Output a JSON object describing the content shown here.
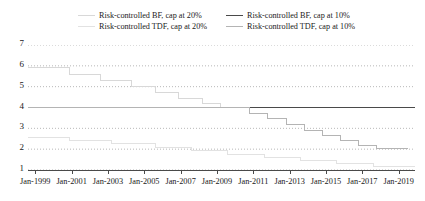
{
  "chart_data": {
    "type": "line",
    "title": "",
    "subtitle": "",
    "xlabel": "",
    "ylabel": "",
    "grid": true,
    "grid_style": "dotted-horizontal",
    "legend_position": "top",
    "legend_columns": 2,
    "step_plot": true,
    "xlim": [
      "Jan-1998",
      "Jan-2020"
    ],
    "ylim": [
      1,
      7
    ],
    "yticks": [
      7,
      6,
      5,
      4,
      3,
      2,
      1
    ],
    "xticks": [
      "Jan-1999",
      "Jan-2001",
      "Jan-2003",
      "Jan-2005",
      "Jan-2007",
      "Jan-2009",
      "Jan-2011",
      "Jan-2013",
      "Jan-2015",
      "Jan-2017",
      "Jan-2019"
    ],
    "x_start_year": 1998.6,
    "x_end_year": 2019.9,
    "series": [
      {
        "name": "Risk-controlled BF, cap at 20%",
        "color": "#d8d8d8",
        "width": 1.0,
        "points": [
          [
            1998.6,
            5.92
          ],
          [
            2000.9,
            5.92
          ],
          [
            2000.9,
            5.6
          ],
          [
            2002.6,
            5.6
          ],
          [
            2002.6,
            5.3
          ],
          [
            2004.3,
            5.3
          ],
          [
            2004.3,
            5.02
          ],
          [
            2005.6,
            5.02
          ],
          [
            2005.6,
            4.72
          ],
          [
            2006.9,
            4.72
          ],
          [
            2006.9,
            4.42
          ],
          [
            2008.2,
            4.42
          ],
          [
            2008.2,
            4.18
          ],
          [
            2009.2,
            4.18
          ],
          [
            2009.2,
            3.98
          ],
          [
            2019.9,
            3.98
          ]
        ]
      },
      {
        "name": "Risk-controlled BF, cap at 10%",
        "color": "#4a4a4a",
        "width": 1.1,
        "points": [
          [
            1998.6,
            4.02
          ],
          [
            2019.9,
            4.02
          ]
        ]
      },
      {
        "name": "Risk-controlled TDF, cap at 20%",
        "color": "#e2e2e2",
        "width": 1.0,
        "points": [
          [
            1998.6,
            2.58
          ],
          [
            2000.9,
            2.58
          ],
          [
            2000.9,
            2.42
          ],
          [
            2003.2,
            2.42
          ],
          [
            2003.2,
            2.25
          ],
          [
            2005.6,
            2.25
          ],
          [
            2005.6,
            2.08
          ],
          [
            2007.6,
            2.08
          ],
          [
            2007.6,
            1.92
          ],
          [
            2009.6,
            1.92
          ],
          [
            2009.6,
            1.75
          ],
          [
            2011.6,
            1.75
          ],
          [
            2011.6,
            1.6
          ],
          [
            2013.6,
            1.6
          ],
          [
            2013.6,
            1.45
          ],
          [
            2015.6,
            1.45
          ],
          [
            2015.6,
            1.3
          ],
          [
            2017.6,
            1.3
          ],
          [
            2017.6,
            1.18
          ],
          [
            2019.9,
            1.18
          ]
        ]
      },
      {
        "name": "Risk-controlled TDF, cap at 10%",
        "color": "#b4b4b4",
        "width": 1.0,
        "points": [
          [
            1998.6,
            3.98
          ],
          [
            2010.8,
            3.98
          ],
          [
            2010.8,
            3.72
          ],
          [
            2011.8,
            3.72
          ],
          [
            2011.8,
            3.45
          ],
          [
            2012.8,
            3.45
          ],
          [
            2012.8,
            3.18
          ],
          [
            2013.8,
            3.18
          ],
          [
            2013.8,
            2.92
          ],
          [
            2014.8,
            2.92
          ],
          [
            2014.8,
            2.65
          ],
          [
            2015.8,
            2.65
          ],
          [
            2015.8,
            2.42
          ],
          [
            2016.8,
            2.42
          ],
          [
            2016.8,
            2.2
          ],
          [
            2017.8,
            2.2
          ],
          [
            2017.8,
            2.02
          ],
          [
            2019.5,
            2.02
          ]
        ]
      }
    ]
  },
  "legend": {
    "items": [
      {
        "label": "Risk-controlled BF, cap at 20%",
        "color": "#d8d8d8"
      },
      {
        "label": "Risk-controlled BF, cap at 10%",
        "color": "#4a4a4a"
      },
      {
        "label": "Risk-controlled TDF, cap at 20%",
        "color": "#e2e2e2"
      },
      {
        "label": "Risk-controlled TDF, cap at 10%",
        "color": "#b4b4b4"
      }
    ]
  },
  "axes": {
    "y_labels": [
      "7",
      "6",
      "5",
      "4",
      "3",
      "2",
      "1"
    ],
    "x_labels": [
      "Jan-1999",
      "Jan-2001",
      "Jan-2003",
      "Jan-2005",
      "Jan-2007",
      "Jan-2009",
      "Jan-2011",
      "Jan-2013",
      "Jan-2015",
      "Jan-2017",
      "Jan-2019"
    ]
  }
}
